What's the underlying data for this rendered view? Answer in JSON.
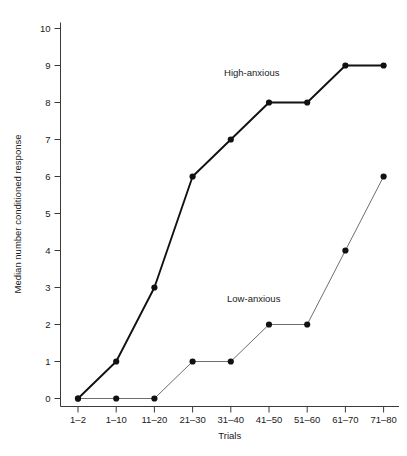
{
  "chart_data": {
    "type": "line",
    "title": "",
    "xlabel": "Trials",
    "ylabel": "Median number conditioned response",
    "categories": [
      "1–2",
      "1–10",
      "11–20",
      "21–30",
      "31–40",
      "41–50",
      "51–60",
      "61–70",
      "71–80"
    ],
    "ylim": [
      0,
      10
    ],
    "yticks": [
      0,
      1,
      2,
      3,
      4,
      5,
      6,
      7,
      8,
      9,
      10
    ],
    "ytick_labels": [
      "0",
      "1",
      "2",
      "3",
      "4",
      "5",
      "6",
      "7",
      "8",
      "9",
      "10"
    ],
    "grid": false,
    "legend_position": "inline-annotation",
    "series": [
      {
        "name": "High-anxious",
        "values": [
          0,
          1,
          3,
          6,
          7,
          8,
          8,
          9,
          9
        ],
        "color": "#111111",
        "line_width": 1.9,
        "marker": "filled-circle",
        "annotation": {
          "text": "High-anxious",
          "category_index": 4.55,
          "value": 8.72
        }
      },
      {
        "name": "Low-anxious",
        "values": [
          0,
          0,
          0,
          1,
          1,
          2,
          2,
          4,
          6
        ],
        "color": "#6e6e6e",
        "line_width": 1.0,
        "marker": "filled-circle",
        "annotation": {
          "text": "Low-anxious",
          "category_index": 4.6,
          "value": 2.62
        }
      }
    ]
  }
}
